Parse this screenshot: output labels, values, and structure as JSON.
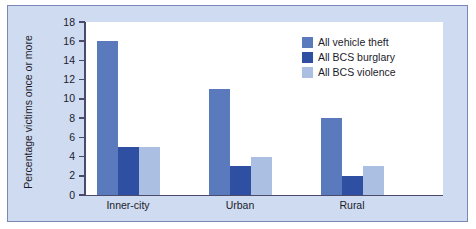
{
  "chart_data": {
    "type": "bar",
    "title": "",
    "subtitle": "",
    "xlabel": "",
    "ylabel": "Percentage victims once or more",
    "categories": [
      "Inner-city",
      "Urban",
      "Rural"
    ],
    "series": [
      {
        "name": "All vehicle theft",
        "values": [
          16,
          11,
          8
        ],
        "color": "#5b79bd"
      },
      {
        "name": "All BCS burglary",
        "values": [
          5,
          3,
          2
        ],
        "color": "#2f4fa3"
      },
      {
        "name": "All BCS violence",
        "values": [
          5,
          4,
          3
        ],
        "color": "#aabfe2"
      }
    ],
    "ylim": [
      0,
      18
    ],
    "ytick_step": 2,
    "yticks": [
      0,
      2,
      4,
      6,
      8,
      10,
      12,
      14,
      16,
      18
    ],
    "grid": false,
    "legend_position": "top-right",
    "annotations": []
  },
  "legend": {
    "entries": [
      {
        "label": "All vehicle theft",
        "swatch": "legend-swatch-vehicle-theft"
      },
      {
        "label": "All BCS burglary",
        "swatch": "legend-swatch-bcs-burglary"
      },
      {
        "label": "All BCS violence",
        "swatch": "legend-swatch-bcs-violence"
      }
    ]
  },
  "colors": {
    "series_1": "#5b79bd",
    "series_2": "#2f4fa3",
    "series_3": "#aabfe2",
    "panel_background": "#cfdbf0",
    "plot_background": "#ffffff",
    "frame_border": "#7a86b8",
    "axis": "#4a4a6a",
    "text": "#1b1b2b"
  }
}
